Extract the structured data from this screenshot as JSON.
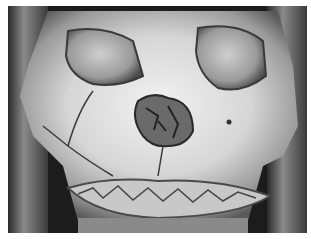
{
  "image": {
    "subject": "3D CT reconstruction of skull, frontal view, showing facial fractures",
    "palette": {
      "background": "#ffffff",
      "dark": "#1a1a1a",
      "bone_light": "#e8e8e8",
      "bone_mid": "#b0b0b0",
      "bone_shadow": "#5a5a5a"
    }
  }
}
